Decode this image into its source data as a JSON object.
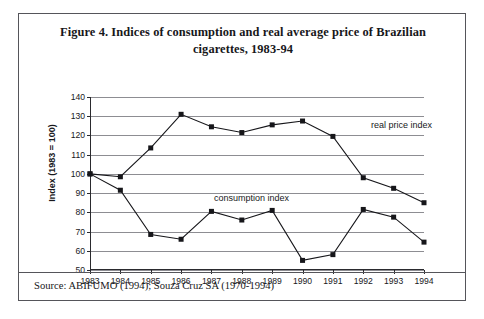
{
  "figure": {
    "title": "Figure 4. Indices of consumption and real average price of Brazilian cigarettes, 1983-94",
    "title_line1": "Figure 4. Indices of consumption and real average price of Brazilian",
    "title_line2": "cigarettes, 1983-94",
    "source": "Source: ABIFUMO (1994); Souza Cruz SA (1970-1994)"
  },
  "chart_data": {
    "type": "line",
    "title": "Figure 4. Indices of consumption and real average price of Brazilian cigarettes, 1983-94",
    "xlabel": "",
    "ylabel": "Index (1983 = 100)",
    "categories": [
      "1983",
      "1984",
      "1985",
      "1986",
      "1987",
      "1988",
      "1989",
      "1990",
      "1991",
      "1992",
      "1993",
      "1994"
    ],
    "ylim": [
      50,
      140
    ],
    "ytick_step": 10,
    "yticks": [
      140,
      130,
      120,
      110,
      100,
      90,
      80,
      70,
      60,
      50
    ],
    "grid": true,
    "legend_position": "inline-annotation",
    "marker": "square",
    "line_color": "#16161a",
    "marker_color": "#16161a",
    "grid_color": "#8d8d92",
    "series": [
      {
        "name": "real price index",
        "values": [
          100,
          98.5,
          113.5,
          131,
          124.5,
          121.5,
          125.5,
          127.5,
          119.5,
          98,
          92.5,
          85
        ]
      },
      {
        "name": "consumption index",
        "values": [
          100,
          91.5,
          68.5,
          66,
          80.5,
          76,
          81,
          55,
          58,
          81.5,
          77.5,
          64.5
        ]
      }
    ],
    "annotations": [
      {
        "text": "real price index",
        "series": "real price index"
      },
      {
        "text": "consumption index",
        "series": "consumption index"
      }
    ]
  }
}
